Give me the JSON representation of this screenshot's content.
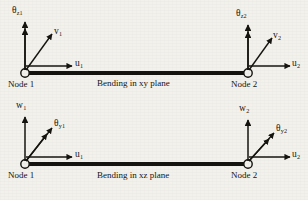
{
  "figure": {
    "background_color": "#f3f1ec",
    "ink_color": "#16140f"
  },
  "diagrams": [
    {
      "id": "xy",
      "caption": "Bending in xy plane",
      "node1": {
        "label": "Node 1",
        "dof": {
          "rotation": {
            "symbol": "θ",
            "subscript": "z1"
          },
          "transverse": {
            "symbol": "v",
            "subscript": "1"
          },
          "axial": {
            "symbol": "u",
            "subscript": "1"
          }
        }
      },
      "node2": {
        "label": "Node 2",
        "dof": {
          "rotation": {
            "symbol": "θ",
            "subscript": "z2"
          },
          "transverse": {
            "symbol": "v",
            "subscript": "2"
          },
          "axial": {
            "symbol": "u",
            "subscript": "2"
          }
        }
      }
    },
    {
      "id": "xz",
      "caption": "Bending in xz plane",
      "node1": {
        "label": "Node 1",
        "dof": {
          "transverse": {
            "symbol": "w",
            "subscript": "1"
          },
          "rotation": {
            "symbol": "θ",
            "subscript": "y1"
          },
          "axial": {
            "symbol": "u",
            "subscript": "1"
          }
        }
      },
      "node2": {
        "label": "Node 2",
        "dof": {
          "transverse": {
            "symbol": "w",
            "subscript": "2"
          },
          "rotation": {
            "symbol": "θ",
            "subscript": "y2"
          },
          "axial": {
            "symbol": "u",
            "subscript": "2"
          }
        }
      }
    }
  ],
  "geometry": {
    "beam_top_y": 73,
    "beam_bottom_y": 164,
    "node1_x": 25,
    "node2_x": 248
  }
}
